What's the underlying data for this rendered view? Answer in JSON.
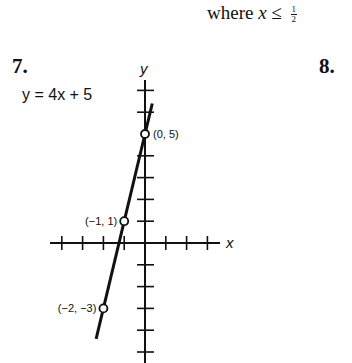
{
  "header": {
    "condition_prefix": "where ",
    "condition_var": "x",
    "condition_op": " ≤ ",
    "condition_num": "1",
    "condition_den": "2"
  },
  "problems": {
    "left_number": "7.",
    "right_number": "8."
  },
  "graph": {
    "equation": "y = 4x + 5",
    "x_axis_label": "x",
    "y_axis_label": "y"
  },
  "chart_data": {
    "type": "line",
    "title": "y = 4x + 5",
    "xlabel": "x",
    "ylabel": "y",
    "grid": false,
    "x_ticks": [
      -4,
      -3,
      -2,
      -1,
      1,
      2,
      3
    ],
    "y_ticks": [
      -5,
      -4,
      -3,
      -2,
      -1,
      1,
      2,
      3,
      4,
      6,
      7
    ],
    "xlim": [
      -4.5,
      3.5
    ],
    "ylim": [
      -5.5,
      7.5
    ],
    "series": [
      {
        "name": "y = 4x + 5",
        "x": [
          -2.35,
          0.35
        ],
        "y": [
          -4.4,
          6.4
        ]
      }
    ],
    "points": [
      {
        "x": 0,
        "y": 5,
        "label": "(0, 5)"
      },
      {
        "x": -1,
        "y": 1,
        "label": "(−1, 1)"
      },
      {
        "x": -2,
        "y": -3,
        "label": "(−2, −3)"
      }
    ]
  }
}
